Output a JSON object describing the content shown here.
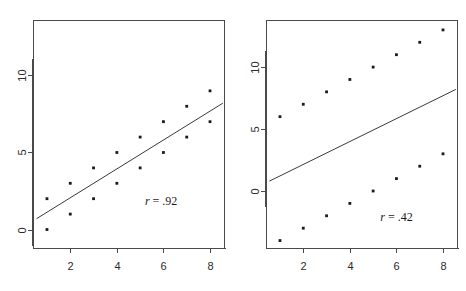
{
  "figure": {
    "width": 466,
    "height": 291,
    "background": "#ffffff",
    "point_color": "#1a1a1a",
    "line_color": "#3a3a3a",
    "axis_color": "#4a4a4a"
  },
  "chart_data": [
    {
      "type": "scatter",
      "panel": "left",
      "title": "",
      "xlabel": "",
      "ylabel": "",
      "xlim": [
        0.4,
        8.6
      ],
      "ylim": [
        -1.2,
        13.6
      ],
      "xticks": [
        2,
        4,
        6,
        8
      ],
      "xtick_labels": [
        "2",
        "4",
        "6",
        "8"
      ],
      "yticks": [
        0,
        5,
        10
      ],
      "ytick_labels": [
        "0",
        "5",
        "10"
      ],
      "grid": false,
      "legend": null,
      "annotation": "r = .92",
      "annotation_stat": "r",
      "annotation_value": ".92",
      "annotation_x": 5.9,
      "annotation_y": 1.6,
      "x": [
        1,
        1,
        2,
        2,
        3,
        3,
        4,
        4,
        5,
        5,
        6,
        6,
        7,
        7,
        8,
        8
      ],
      "y": [
        0,
        2,
        1,
        3,
        2,
        4,
        3,
        5,
        4,
        6,
        5,
        7,
        6,
        8,
        7,
        9
      ],
      "trendline": {
        "x0": 0.55,
        "y0": 0.7,
        "x1": 8.55,
        "y1": 8.2
      }
    },
    {
      "type": "scatter",
      "panel": "right",
      "title": "",
      "xlabel": "",
      "ylabel": "",
      "xlim": [
        0.4,
        8.6
      ],
      "ylim": [
        -4.6,
        13.8
      ],
      "xticks": [
        2,
        4,
        6,
        8
      ],
      "xtick_labels": [
        "2",
        "4",
        "6",
        "8"
      ],
      "yticks": [
        0,
        5,
        10
      ],
      "ytick_labels": [
        "0",
        "5",
        "10"
      ],
      "grid": false,
      "legend": null,
      "annotation": "r = .42",
      "annotation_stat": "r",
      "annotation_value": ".42",
      "annotation_x": 6.0,
      "annotation_y": -2.4,
      "x": [
        1,
        2,
        3,
        4,
        5,
        6,
        7,
        8,
        1,
        2,
        3,
        4,
        5,
        6,
        7,
        8
      ],
      "y": [
        6,
        7,
        8,
        9,
        10,
        11,
        12,
        13,
        -4,
        -3,
        -2,
        -1,
        0,
        1,
        2,
        3
      ],
      "trendline": {
        "x0": 0.55,
        "y0": 0.8,
        "x1": 8.55,
        "y1": 8.2
      }
    }
  ]
}
